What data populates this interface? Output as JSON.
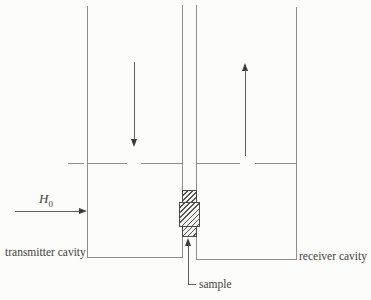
{
  "diagram": {
    "labels": {
      "transmitter_cavity": "transmitter cavity",
      "receiver_cavity": "receiver cavity",
      "sample": "sample",
      "field": {
        "base": "H",
        "sub": "0"
      }
    },
    "colors": {
      "background": "#fcfcfa",
      "structure_line": "#8e8e8e",
      "arrow": "#3a3a3a",
      "text": "#45413c"
    }
  }
}
